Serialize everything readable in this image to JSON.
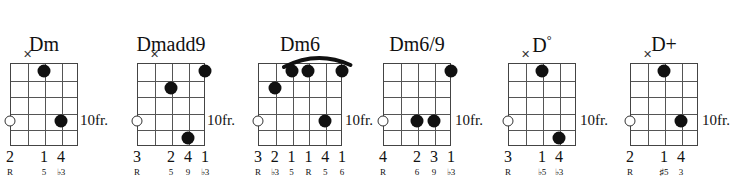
{
  "diagram": {
    "type": "guitar-chord-chart",
    "root": "D",
    "position_label": "10fr.",
    "chords": [
      {
        "name": "Dm",
        "strings": 5,
        "frets": 5,
        "position": "10fr.",
        "barre": null,
        "markers": [
          {
            "string": 2,
            "type": "mute",
            "symbol": "✕"
          }
        ],
        "open_strings": [
          1
        ],
        "dots": [
          {
            "string": 3,
            "fret": 1
          },
          {
            "string": 4,
            "fret": 4
          }
        ],
        "fingers": [
          "2",
          "",
          "1",
          "4",
          ""
        ],
        "intervals": [
          "R",
          "",
          "5",
          "♭3",
          ""
        ]
      },
      {
        "name": "Dmadd9",
        "strings": 5,
        "frets": 5,
        "position": "10fr.",
        "barre": null,
        "markers": [
          {
            "string": 2,
            "type": "mute",
            "symbol": "✕"
          }
        ],
        "open_strings": [
          1
        ],
        "dots": [
          {
            "string": 3,
            "fret": 2
          },
          {
            "string": 4,
            "fret": 5
          },
          {
            "string": 5,
            "fret": 1
          }
        ],
        "fingers": [
          "3",
          "",
          "2",
          "4",
          "1"
        ],
        "intervals": [
          "R",
          "",
          "5",
          "9",
          "♭3"
        ]
      },
      {
        "name": "Dm6",
        "strings": 6,
        "frets": 5,
        "position": "10fr.",
        "barre": {
          "from_string": 3,
          "to_string": 6,
          "fret": 1
        },
        "markers": [],
        "open_strings": [
          1
        ],
        "dots": [
          {
            "string": 2,
            "fret": 2
          },
          {
            "string": 3,
            "fret": 1
          },
          {
            "string": 4,
            "fret": 1
          },
          {
            "string": 5,
            "fret": 4
          },
          {
            "string": 6,
            "fret": 1
          }
        ],
        "fingers": [
          "3",
          "2",
          "1",
          "1",
          "4",
          "1"
        ],
        "intervals": [
          "R",
          "♭3",
          "5",
          "R",
          "5",
          "6"
        ]
      },
      {
        "name": "Dm6/9",
        "strings": 5,
        "frets": 5,
        "position": "10fr.",
        "barre": null,
        "markers": [],
        "open_strings": [
          1
        ],
        "dots": [
          {
            "string": 3,
            "fret": 4
          },
          {
            "string": 4,
            "fret": 4
          },
          {
            "string": 5,
            "fret": 1
          }
        ],
        "fingers": [
          "4",
          "",
          "2",
          "3",
          "1"
        ],
        "intervals": [
          "R",
          "",
          "6",
          "9",
          "♭3"
        ]
      },
      {
        "name": "D°",
        "name_base": "D",
        "name_sup": "°",
        "strings": 5,
        "frets": 5,
        "position": "10fr.",
        "barre": null,
        "markers": [
          {
            "string": 2,
            "type": "mute",
            "symbol": "✕"
          }
        ],
        "open_strings": [
          1
        ],
        "dots": [
          {
            "string": 3,
            "fret": 1
          },
          {
            "string": 4,
            "fret": 5
          }
        ],
        "fingers": [
          "3",
          "",
          "1",
          "4",
          ""
        ],
        "intervals": [
          "R",
          "",
          "♭5",
          "♭3",
          ""
        ]
      },
      {
        "name": "D+",
        "strings": 5,
        "frets": 5,
        "position": "10fr.",
        "barre": null,
        "markers": [
          {
            "string": 2,
            "type": "mute",
            "symbol": "✕"
          }
        ],
        "open_strings": [
          1
        ],
        "dots": [
          {
            "string": 3,
            "fret": 1
          },
          {
            "string": 4,
            "fret": 4
          }
        ],
        "fingers": [
          "2",
          "",
          "1",
          "4",
          ""
        ],
        "intervals": [
          "R",
          "",
          "♯5",
          "3",
          ""
        ]
      }
    ]
  },
  "colors": {
    "ink": "#111111",
    "grid": "#555555",
    "background": "#ffffff"
  }
}
